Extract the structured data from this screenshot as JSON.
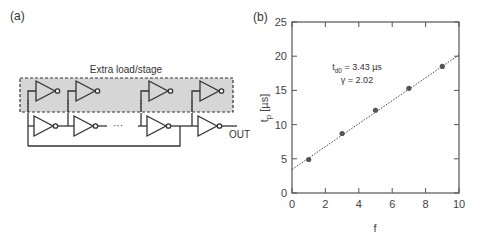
{
  "panels": {
    "a": {
      "label": "(a)",
      "box_label": "Extra load/stage",
      "output_label": "OUT",
      "ellipsis": "···"
    },
    "b": {
      "label": "(b)"
    }
  },
  "chart_data": {
    "type": "scatter",
    "title": "",
    "xlabel": "f",
    "ylabel": "t_p [µs]",
    "xlim": [
      0,
      10
    ],
    "ylim": [
      0,
      25
    ],
    "x_ticks": [
      0,
      2,
      4,
      6,
      8,
      10
    ],
    "y_ticks": [
      0,
      5,
      10,
      15,
      20,
      25
    ],
    "grid": false,
    "series": [
      {
        "name": "measured",
        "marker": "circle",
        "x": [
          1,
          3,
          5,
          7,
          9
        ],
        "y": [
          4.9,
          8.7,
          12.1,
          15.3,
          18.5
        ]
      },
      {
        "name": "linear fit",
        "style": "dotted line",
        "x": [
          0,
          10
        ],
        "y": [
          3.43,
          20.2
        ]
      }
    ],
    "annotations": [
      {
        "text": "t_d0 = 3.43 µs",
        "main": "t",
        "sub": "d0",
        "rest": " = 3.43 µs"
      },
      {
        "text": "γ = 2.02"
      }
    ]
  }
}
